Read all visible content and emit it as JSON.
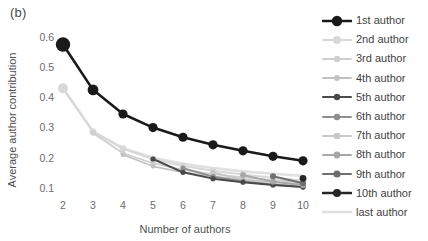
{
  "panel": {
    "label": "(b)"
  },
  "legend": {
    "position": "right",
    "items": [
      {
        "label": "1st author",
        "color": "#1a1a1a",
        "line_width": 2.6,
        "marker_size": 4.6
      },
      {
        "label": "2nd author",
        "color": "#d8d8d8",
        "line_width": 2.0,
        "marker_size": 3.4
      },
      {
        "label": "3rd author",
        "color": "#cfcfcf",
        "line_width": 1.8,
        "marker_size": 2.6
      },
      {
        "label": "4th author",
        "color": "#c2c2c2",
        "line_width": 1.8,
        "marker_size": 2.4
      },
      {
        "label": "5th author",
        "color": "#4a4a4a",
        "line_width": 2.0,
        "marker_size": 2.6
      },
      {
        "label": "6th author",
        "color": "#8f8f8f",
        "line_width": 1.8,
        "marker_size": 2.6
      },
      {
        "label": "7th author",
        "color": "#c8c8c8",
        "line_width": 1.8,
        "marker_size": 2.6
      },
      {
        "label": "8th author",
        "color": "#a6a6a6",
        "line_width": 1.8,
        "marker_size": 2.8
      },
      {
        "label": "9th author",
        "color": "#6e6e6e",
        "line_width": 2.0,
        "marker_size": 3.0
      },
      {
        "label": "10th author",
        "color": "#262626",
        "line_width": 2.6,
        "marker_size": 3.4
      },
      {
        "label": "last author",
        "color": "#e0e0e0",
        "line_width": 2.6,
        "marker_size": 0
      }
    ]
  },
  "chart_data": {
    "type": "line",
    "title": "",
    "xlabel": "Number of authors",
    "ylabel": "Average author contribution",
    "x": [
      2,
      3,
      4,
      5,
      6,
      7,
      8,
      9,
      10
    ],
    "xlim": [
      1.7,
      10.3
    ],
    "ylim": [
      0.055,
      0.625
    ],
    "xticks": [
      2,
      3,
      4,
      5,
      6,
      7,
      8,
      9,
      10
    ],
    "yticks": [
      0.1,
      0.2,
      0.3,
      0.4,
      0.5,
      0.6
    ],
    "ytick_labels": [
      "0.1",
      "0.2",
      "0.3",
      "0.4",
      "0.5",
      "0.6"
    ],
    "grid": false,
    "legend_position": "right",
    "series": [
      {
        "name": "1st author",
        "x": [
          2,
          3,
          4,
          5,
          6,
          7,
          8,
          9,
          10
        ],
        "values": [
          0.575,
          0.425,
          0.345,
          0.3,
          0.268,
          0.243,
          0.223,
          0.205,
          0.19
        ]
      },
      {
        "name": "2nd author",
        "x": [
          2,
          3,
          4,
          5,
          6,
          7,
          8,
          9,
          10
        ],
        "values": [
          0.43,
          0.287,
          0.23,
          0.196,
          0.173,
          0.157,
          0.145,
          0.134,
          0.125
        ]
      },
      {
        "name": "3rd author",
        "x": [
          3,
          4,
          5,
          6,
          7,
          8,
          9,
          10
        ],
        "values": [
          0.282,
          0.215,
          0.182,
          0.16,
          0.146,
          0.135,
          0.126,
          0.119
        ]
      },
      {
        "name": "4th author",
        "x": [
          4,
          5,
          6,
          7,
          8,
          9,
          10
        ],
        "values": [
          0.21,
          0.172,
          0.152,
          0.138,
          0.128,
          0.12,
          0.113
        ]
      },
      {
        "name": "5th author",
        "x": [
          5,
          6,
          7,
          8,
          9,
          10
        ],
        "values": [
          0.196,
          0.152,
          0.131,
          0.119,
          0.11,
          0.103
        ]
      },
      {
        "name": "6th author",
        "x": [
          6,
          7,
          8,
          9,
          10
        ],
        "values": [
          0.166,
          0.138,
          0.122,
          0.111,
          0.104
        ]
      },
      {
        "name": "7th author",
        "x": [
          7,
          8,
          9,
          10
        ],
        "values": [
          0.152,
          0.128,
          0.114,
          0.105
        ]
      },
      {
        "name": "8th author",
        "x": [
          8,
          9,
          10
        ],
        "values": [
          0.143,
          0.121,
          0.109
        ]
      },
      {
        "name": "9th author",
        "x": [
          9,
          10
        ],
        "values": [
          0.139,
          0.116
        ]
      },
      {
        "name": "10th author",
        "x": [
          10
        ],
        "values": [
          0.132
        ]
      },
      {
        "name": "last author",
        "x": [
          2,
          3,
          4,
          5,
          6,
          7,
          8,
          9,
          10
        ],
        "values": [
          0.43,
          0.287,
          0.232,
          0.2,
          0.18,
          0.166,
          0.155,
          0.147,
          0.14
        ]
      }
    ]
  }
}
